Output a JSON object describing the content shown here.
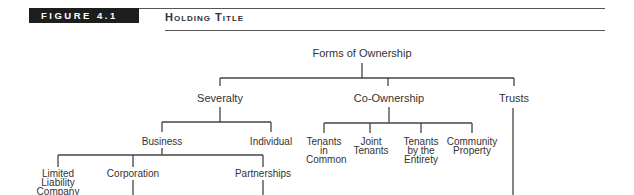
{
  "figure": {
    "label": "FIGURE 4.1",
    "title": "Holding Title"
  },
  "diagram": {
    "root": "Forms of Ownership",
    "level1": [
      "Severalty",
      "Co-Ownership",
      "Trusts"
    ],
    "severalty_children": [
      "Business",
      "Individual"
    ],
    "coownership_children": [
      "Tenants in Common",
      "Joint Tenants",
      "Tenants by the Entirety",
      "Community Property"
    ],
    "business_children": [
      "Limited Liability Company",
      "Corporation",
      "Partnerships"
    ]
  },
  "colors": {
    "badge_bg": "#1e1e1e",
    "line": "#444444",
    "text": "#333333"
  }
}
